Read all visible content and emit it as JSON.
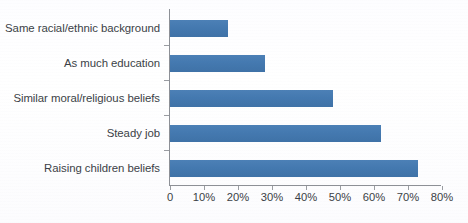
{
  "chart_data": {
    "type": "bar",
    "orientation": "horizontal",
    "title": "",
    "subtitle": "",
    "xlabel": "",
    "ylabel": "",
    "xlim": [
      0,
      80
    ],
    "grid": false,
    "legend": false,
    "legend_position": "none",
    "bar_color": "#4479b0",
    "axis_color": "#8d9096",
    "text_color": "#3b3f46",
    "categories": [
      "Same racial/ethnic background",
      "As much education",
      "Similar moral/religious beliefs",
      "Steady job",
      "Raising children beliefs"
    ],
    "values": [
      17,
      28,
      48,
      62,
      73
    ],
    "tick_values": [
      0,
      10,
      20,
      30,
      40,
      50,
      60,
      70,
      80
    ],
    "tick_labels": [
      "0",
      "10%",
      "20%",
      "30%",
      "40%",
      "50%",
      "60%",
      "70%",
      "80%"
    ]
  }
}
